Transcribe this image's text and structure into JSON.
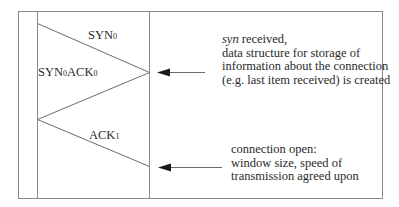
{
  "diagram": {
    "type": "sequence / handshake diagram",
    "messages": [
      {
        "id": "syn",
        "base": "SYN",
        "subscript": "0",
        "direction": "left-to-right"
      },
      {
        "id": "synack",
        "base1": "SYN",
        "sub1": "0",
        "base2": "ACK",
        "sub2": "0",
        "direction": "right-to-left"
      },
      {
        "id": "ack",
        "base": "ACK",
        "subscript": "1",
        "direction": "left-to-right"
      }
    ],
    "annotations": [
      {
        "id": "syn-received",
        "italic_word": "syn",
        "first_line_rest": " received,",
        "lines": [
          "data structure for storage of",
          "information about the connection",
          "(e.g. last item received) is created"
        ]
      },
      {
        "id": "connection-open",
        "lines": [
          "connection open:",
          "window size, speed of",
          "transmission agreed upon"
        ]
      }
    ],
    "colors": {
      "line": "#6b6b6b",
      "frame": "#8a8a8a",
      "arrow": "#1a1a1a",
      "text": "#2a2a2a"
    }
  }
}
